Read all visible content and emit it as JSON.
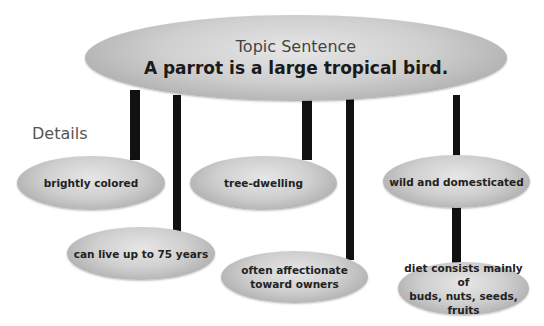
{
  "diagram": {
    "topic": {
      "heading": "Topic Sentence",
      "sentence": "A parrot is a large tropical bird."
    },
    "details_label": "Details",
    "details": [
      {
        "lines": [
          "brightly colored"
        ]
      },
      {
        "lines": [
          "tree-dwelling"
        ]
      },
      {
        "lines": [
          "wild and domesticated"
        ]
      },
      {
        "lines": [
          "can live up to 75 years"
        ]
      },
      {
        "lines": [
          "often affectionate",
          "toward owners"
        ]
      },
      {
        "lines": [
          "diet consists mainly of",
          "buds, nuts, seeds, fruits"
        ]
      }
    ],
    "colors": {
      "oval_fill": "#c8c8c8",
      "connector": "#111111",
      "background": "#ffffff"
    }
  }
}
